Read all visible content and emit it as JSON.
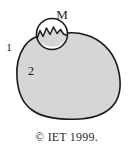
{
  "figure": {
    "type": "schematic-diagram",
    "labels": {
      "circle_label": "M",
      "outer_region_label": "1",
      "inner_region_label": "2"
    },
    "caption": "© IET 1999.",
    "colors": {
      "region_fill": "#d6d6d6",
      "outline": "#1a1a1a",
      "circle_fill": "#ffffff",
      "background": "#ffffff",
      "text": "#1a1a1a"
    },
    "geometry": {
      "blob_center": [
        70,
        72
      ],
      "circle_center": [
        52,
        34
      ],
      "circle_radius": 16
    }
  }
}
